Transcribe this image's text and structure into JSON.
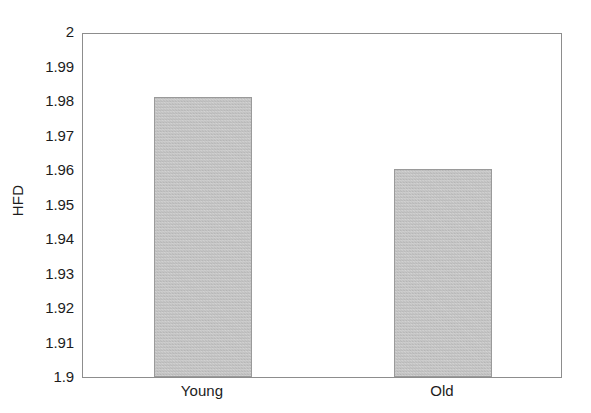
{
  "chart_data": {
    "type": "bar",
    "title": "",
    "xlabel": "",
    "ylabel": "HFD",
    "categories": [
      "Young",
      "Old"
    ],
    "values": [
      1.9813,
      1.9602
    ],
    "ylim": [
      1.9,
      2.0
    ],
    "yticks": [
      "1.9",
      "1.91",
      "1.92",
      "1.93",
      "1.94",
      "1.95",
      "1.96",
      "1.97",
      "1.98",
      "1.99",
      "2"
    ],
    "ytick_values": [
      1.9,
      1.91,
      1.92,
      1.93,
      1.94,
      1.95,
      1.96,
      1.97,
      1.98,
      1.99,
      2.0
    ],
    "xticks": [
      "Young",
      "Old"
    ],
    "grid": false,
    "legend": null,
    "series": [
      {
        "name": "HFD",
        "values": [
          1.9813,
          1.9602
        ]
      }
    ],
    "bar_fill_color": "#c0c0c0",
    "bar_edge_color": "#9a9a9a",
    "axis_color": "#8d8d8d",
    "text_color": "#1c1c1c",
    "background_color": "#ffffff"
  },
  "labels": {
    "y_axis_title": "HFD",
    "bar_young": "Young",
    "bar_old": "Old",
    "ytick_0": "1.9",
    "ytick_1": "1.91",
    "ytick_2": "1.92",
    "ytick_3": "1.93",
    "ytick_4": "1.94",
    "ytick_5": "1.95",
    "ytick_6": "1.96",
    "ytick_7": "1.97",
    "ytick_8": "1.98",
    "ytick_9": "1.99",
    "ytick_10": "2"
  }
}
